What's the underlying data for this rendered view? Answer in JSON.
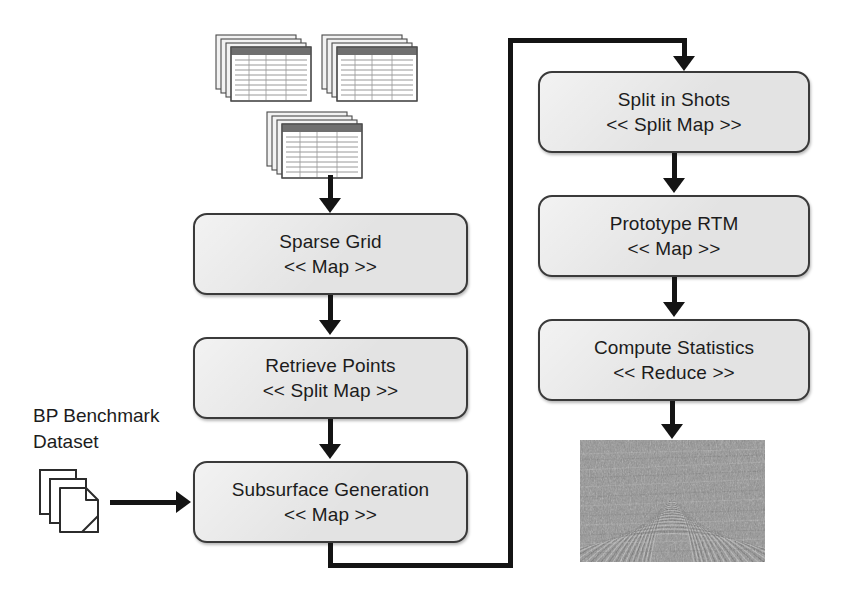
{
  "diagram": {
    "background_color": "#ffffff",
    "box_fill": "#e3e3e3",
    "box_border": "#3a3a3a",
    "connector_color": "#141414",
    "left_column": {
      "boxes": [
        {
          "id": "sparse-grid",
          "title": "Sparse Grid",
          "stereotype": "<< Map >>"
        },
        {
          "id": "retrieve-points",
          "title": "Retrieve Points",
          "stereotype": "<< Split Map >>"
        },
        {
          "id": "subsurface-generation",
          "title": "Subsurface Generation",
          "stereotype": "<< Map >>"
        }
      ]
    },
    "right_column": {
      "boxes": [
        {
          "id": "split-in-shots",
          "title": "Split in Shots",
          "stereotype": "<< Split Map >>"
        },
        {
          "id": "prototype-rtm",
          "title": "Prototype RTM",
          "stereotype": "<< Map >>"
        },
        {
          "id": "compute-statistics",
          "title": "Compute Statistics",
          "stereotype": "<< Reduce >>"
        }
      ]
    },
    "inputs": {
      "dataset_label": "BP Benchmark\nDataset",
      "dataset_icon": "document-stack-icon",
      "sheet_stacks_icon": "spreadsheet-stack-icon",
      "sheet_stack_count": 3
    },
    "output": {
      "id": "seismic-result",
      "icon": "seismic-image",
      "description": "Migrated seismic image"
    },
    "connectors": [
      {
        "id": "sheets-to-sparse-grid",
        "from": "spreadsheet-stacks",
        "to": "sparse-grid",
        "arrow": "down"
      },
      {
        "id": "sparse-grid-to-retrieve-points",
        "from": "sparse-grid",
        "to": "retrieve-points",
        "arrow": "down"
      },
      {
        "id": "retrieve-points-to-subsurface",
        "from": "retrieve-points",
        "to": "subsurface-generation",
        "arrow": "down"
      },
      {
        "id": "dataset-to-subsurface",
        "from": "dataset",
        "to": "subsurface-generation",
        "arrow": "right"
      },
      {
        "id": "subsurface-to-split-in-shots",
        "from": "subsurface-generation",
        "to": "split-in-shots",
        "arrow": "down"
      },
      {
        "id": "split-in-shots-to-prototype-rtm",
        "from": "split-in-shots",
        "to": "prototype-rtm",
        "arrow": "down"
      },
      {
        "id": "prototype-rtm-to-compute-statistics",
        "from": "prototype-rtm",
        "to": "compute-statistics",
        "arrow": "down"
      },
      {
        "id": "compute-statistics-to-result",
        "from": "compute-statistics",
        "to": "seismic-result",
        "arrow": "down"
      }
    ]
  }
}
